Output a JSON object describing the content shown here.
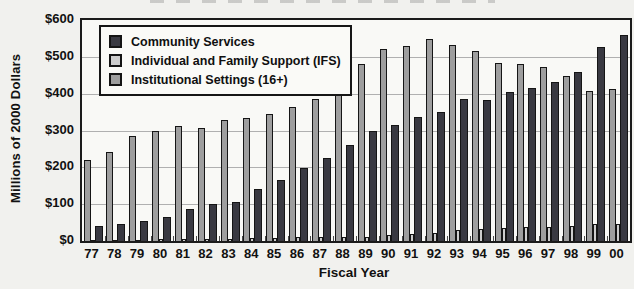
{
  "page": {
    "background": "#f1f1ee"
  },
  "chart_data": {
    "type": "bar",
    "title": "",
    "xlabel": "Fiscal Year",
    "ylabel": "Millions of 2000 Dollars",
    "ylim": [
      0,
      600
    ],
    "ytick_step": 100,
    "ytick_labels": [
      "$0",
      "$100",
      "$200",
      "$300",
      "$400",
      "$500",
      "$600"
    ],
    "grid": "horizontal",
    "legend_position": "top-left-inside",
    "categories": [
      "77",
      "78",
      "79",
      "80",
      "81",
      "82",
      "83",
      "84",
      "85",
      "86",
      "87",
      "88",
      "89",
      "90",
      "91",
      "92",
      "93",
      "94",
      "95",
      "96",
      "97",
      "98",
      "99",
      "00"
    ],
    "series": [
      {
        "name": "Community Services",
        "color": "#393941",
        "values": [
          40,
          46,
          55,
          65,
          88,
          100,
          107,
          140,
          165,
          198,
          225,
          262,
          298,
          315,
          337,
          350,
          385,
          382,
          405,
          415,
          432,
          460,
          528,
          558
        ]
      },
      {
        "name": "Individual and Family Support (IFS)",
        "color": "#cdcdcd",
        "values": [
          3,
          3,
          4,
          5,
          5,
          6,
          6,
          8,
          8,
          10,
          10,
          10,
          12,
          15,
          18,
          22,
          30,
          33,
          35,
          38,
          38,
          40,
          45,
          45
        ]
      },
      {
        "name": "Institutional Settings (16+)",
        "color": "#9e9e9e",
        "values": [
          220,
          243,
          285,
          300,
          312,
          306,
          328,
          333,
          344,
          365,
          386,
          405,
          480,
          520,
          530,
          548,
          533,
          515,
          482,
          480,
          472,
          447,
          408,
          412
        ]
      }
    ],
    "series_draw_order": [
      2,
      1,
      0
    ],
    "colors": {
      "axis": "#1b1b1b",
      "grid": "#b0b0b0",
      "legend_border": "#161616",
      "legend_bg": "#fafaf7",
      "text": "#111111"
    }
  }
}
